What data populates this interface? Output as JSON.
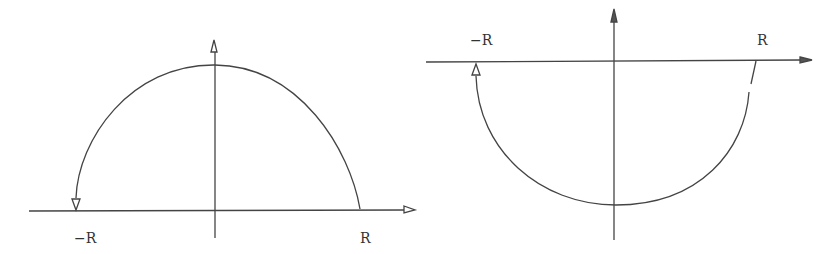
{
  "figures": [
    {
      "name": "upper-semicircle-contour",
      "labels": {
        "left": "−R",
        "right": "R"
      },
      "description": "Upper half-circle contour from R to -R, arrow pointing down at -R"
    },
    {
      "name": "lower-semicircle-contour",
      "labels": {
        "left": "−R",
        "right": "R"
      },
      "description": "Lower half-circle contour from R to -R, arrow pointing up at -R"
    }
  ],
  "colors": {
    "stroke": "#444444",
    "background": "#ffffff"
  }
}
